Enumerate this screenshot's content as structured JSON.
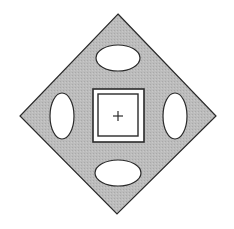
{
  "canvas": {
    "width": 234,
    "height": 229,
    "background": "#ffffff"
  },
  "colors": {
    "fill": "#b9b9b9",
    "stroke": "#2a2a2a",
    "hole": "#ffffff"
  },
  "diamond": {
    "points": "118,14 216,116 117,214 20,116"
  },
  "ellipses": [
    {
      "name": "top",
      "cx": 118,
      "cy": 58,
      "rx": 22,
      "ry": 13
    },
    {
      "name": "left",
      "cx": 62,
      "cy": 116,
      "rx": 12,
      "ry": 23
    },
    {
      "name": "right",
      "cx": 175,
      "cy": 116,
      "rx": 12,
      "ry": 23
    },
    {
      "name": "bottom",
      "cx": 118,
      "cy": 173,
      "rx": 23,
      "ry": 13
    }
  ],
  "center_box": {
    "outer": {
      "x": 93,
      "y": 89,
      "w": 51,
      "h": 53
    },
    "inner": {
      "x": 98,
      "y": 94,
      "w": 40,
      "h": 42
    }
  },
  "crosshair": {
    "cx": 118,
    "cy": 116,
    "size": 5,
    "symbol": "+"
  }
}
